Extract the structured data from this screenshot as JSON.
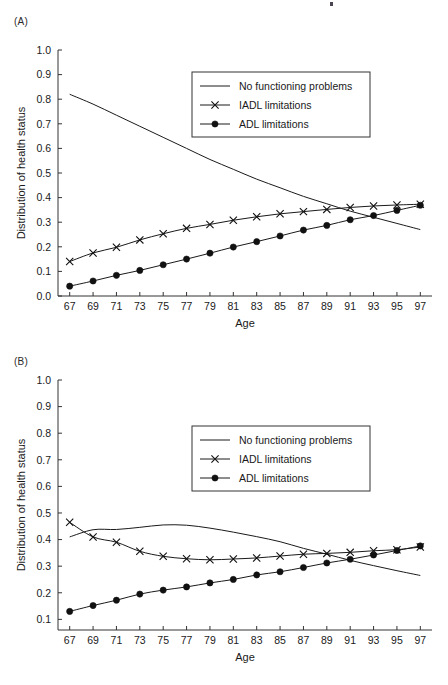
{
  "figure": {
    "panels": [
      {
        "id": "A",
        "label": "(A)",
        "xlabel": "Age",
        "ylabel": "Distribution of health status"
      },
      {
        "id": "B",
        "label": "(B)",
        "xlabel": "Age",
        "ylabel": "Distribution of health status"
      }
    ],
    "legend": {
      "entries": [
        {
          "label": "No functioning problems",
          "marker": "line-icon"
        },
        {
          "label": "IADL limitations",
          "marker": "x-marker-icon"
        },
        {
          "label": "ADL limitations",
          "marker": "dot-marker-icon"
        }
      ]
    },
    "colors": {
      "ink": "#1a1a1a",
      "axis": "#333333",
      "background": "#ffffff"
    }
  },
  "chart_data": [
    {
      "type": "line",
      "panel": "A",
      "title": "(A)",
      "xlabel": "Age",
      "ylabel": "Distribution of health status",
      "x": [
        67,
        69,
        71,
        73,
        75,
        77,
        79,
        81,
        83,
        85,
        87,
        89,
        91,
        93,
        95,
        97
      ],
      "xtick_labels": [
        "67",
        "69",
        "71",
        "73",
        "75",
        "77",
        "79",
        "81",
        "83",
        "85",
        "87",
        "89",
        "91",
        "93",
        "95",
        "97"
      ],
      "ytick_labels": [
        "0.0",
        "0.1",
        "0.2",
        "0.3",
        "0.4",
        "0.5",
        "0.6",
        "0.7",
        "0.8",
        "0.9",
        "1.0"
      ],
      "xlim": [
        66,
        98
      ],
      "ylim": [
        0.0,
        1.0
      ],
      "grid": false,
      "legend_position": "upper-right-inside",
      "series": [
        {
          "name": "No functioning problems",
          "marker": "none",
          "values": [
            0.82,
            0.78,
            0.735,
            0.69,
            0.645,
            0.6,
            0.555,
            0.515,
            0.475,
            0.44,
            0.405,
            0.375,
            0.345,
            0.32,
            0.295,
            0.27
          ]
        },
        {
          "name": "IADL limitations",
          "marker": "x",
          "values": [
            0.14,
            0.175,
            0.198,
            0.228,
            0.253,
            0.275,
            0.291,
            0.308,
            0.322,
            0.334,
            0.343,
            0.352,
            0.36,
            0.366,
            0.37,
            0.373
          ]
        },
        {
          "name": "ADL limitations",
          "marker": "o",
          "values": [
            0.04,
            0.061,
            0.084,
            0.104,
            0.127,
            0.15,
            0.174,
            0.199,
            0.221,
            0.244,
            0.268,
            0.287,
            0.31,
            0.327,
            0.348,
            0.369
          ]
        }
      ]
    },
    {
      "type": "line",
      "panel": "B",
      "title": "(B)",
      "xlabel": "Age",
      "ylabel": "Distribution of health status",
      "x": [
        67,
        69,
        71,
        73,
        75,
        77,
        79,
        81,
        83,
        85,
        87,
        89,
        91,
        93,
        95,
        97
      ],
      "xtick_labels": [
        "67",
        "69",
        "71",
        "73",
        "75",
        "77",
        "79",
        "81",
        "83",
        "85",
        "87",
        "89",
        "91",
        "93",
        "95",
        "97"
      ],
      "ytick_labels": [
        "0.1",
        "0.2",
        "0.3",
        "0.4",
        "0.5",
        "0.6",
        "0.7",
        "0.8",
        "0.9",
        "1.0"
      ],
      "xlim": [
        66,
        98
      ],
      "ylim": [
        0.06,
        1.0
      ],
      "grid": false,
      "legend_position": "upper-right-inside",
      "series": [
        {
          "name": "No functioning problems",
          "marker": "none",
          "values": [
            0.41,
            0.437,
            0.438,
            0.446,
            0.455,
            0.454,
            0.443,
            0.428,
            0.411,
            0.392,
            0.367,
            0.345,
            0.322,
            0.302,
            0.283,
            0.265
          ]
        },
        {
          "name": "IADL limitations",
          "marker": "x",
          "values": [
            0.465,
            0.41,
            0.39,
            0.356,
            0.337,
            0.328,
            0.324,
            0.327,
            0.331,
            0.338,
            0.345,
            0.348,
            0.352,
            0.358,
            0.362,
            0.372
          ]
        },
        {
          "name": "ADL limitations",
          "marker": "o",
          "values": [
            0.13,
            0.152,
            0.172,
            0.195,
            0.21,
            0.222,
            0.237,
            0.25,
            0.267,
            0.279,
            0.295,
            0.312,
            0.326,
            0.342,
            0.359,
            0.376
          ]
        }
      ]
    }
  ]
}
